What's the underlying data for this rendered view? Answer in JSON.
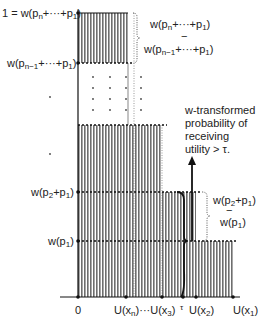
{
  "figure": {
    "y_labels": {
      "top": "1 = w(p",
      "top_sub": "n",
      "top_rest": "+···+p",
      "top_sub2": "1",
      "top_close": ")",
      "n_minus_1": "w(p",
      "n_minus_1_sub": "n−1",
      "n_minus_1_rest": "+···+p",
      "n_minus_1_sub2": "1",
      "n_minus_1_close": ")",
      "p2p1": "w(p",
      "p2p1_sub": "2",
      "p2p1_rest": "+p",
      "p2p1_sub2": "1",
      "p2p1_close": ")",
      "p1": "w(p",
      "p1_sub": "1",
      "p1_close": ")"
    },
    "x_labels": {
      "zero": "0",
      "uxn": "U(x",
      "uxn_sub": "n",
      "uxn_rest": ")···U(x",
      "ux3_sub": "3",
      "ux3_close": ")",
      "tau": "τ",
      "ux2": "U(x",
      "ux2_sub": "2",
      "ux2_close": ")",
      "ux1": "U(x",
      "ux1_sub": "1",
      "ux1_close": ")"
    },
    "bracket_top": {
      "line1": "w(p",
      "line1_sub": "n",
      "line1_rest": "+···+p",
      "line1_sub2": "1",
      "line1_close": ")",
      "minus": "−",
      "line2": "w(p",
      "line2_sub": "n−1",
      "line2_rest": "+···+p",
      "line2_sub2": "1",
      "line2_close": ")"
    },
    "bracket_bottom": {
      "line1": "w(p",
      "line1_sub": "2",
      "line1_rest": "+p",
      "line1_sub2": "1",
      "line1_close": ")",
      "minus": "−",
      "line2": "w(p",
      "line2_sub": "1",
      "line2_close": ")"
    },
    "annotation": {
      "line1": "w-transformed",
      "line2": "probability of",
      "line3": "receiving",
      "line4": "utility > τ."
    },
    "colors": {
      "hatch": "#7a7a7a",
      "line": "#111111",
      "text": "#222222"
    }
  }
}
